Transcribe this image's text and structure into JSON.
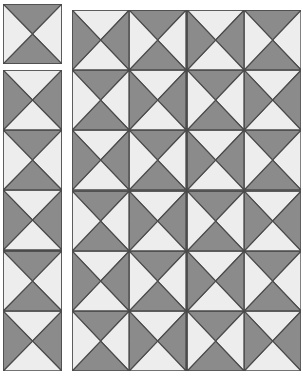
{
  "colors": {
    "dark": "#8b8b8b",
    "light": "#ededed",
    "outline": "#4a4a4a"
  },
  "tile_types": {
    "A": {
      "top": "light",
      "bottom": "light",
      "left": "dark",
      "right": "dark"
    },
    "B": {
      "top": "dark",
      "bottom": "dark",
      "left": "light",
      "right": "light"
    }
  },
  "single_piece": {
    "x": 3,
    "y": 4,
    "w": 59,
    "h": 60,
    "tiles": [
      [
        "B"
      ]
    ]
  },
  "column_strip": {
    "x": 3,
    "y": 70,
    "w": 59,
    "h": 301,
    "rows": 5,
    "cols": 1,
    "tiles": [
      [
        "A"
      ],
      [
        "B"
      ],
      [
        "A"
      ],
      [
        "B"
      ],
      [
        "A"
      ]
    ]
  },
  "main_board": {
    "x": 72,
    "y": 10,
    "w": 229,
    "h": 361,
    "rows": 6,
    "cols": 4,
    "tiles": [
      [
        "A",
        "B",
        "A",
        "B"
      ],
      [
        "B",
        "A",
        "B",
        "A"
      ],
      [
        "A",
        "B",
        "A",
        "B"
      ],
      [
        "B",
        "A",
        "B",
        "A"
      ],
      [
        "A",
        "B",
        "A",
        "B"
      ],
      [
        "B",
        "A",
        "B",
        "A"
      ]
    ]
  }
}
